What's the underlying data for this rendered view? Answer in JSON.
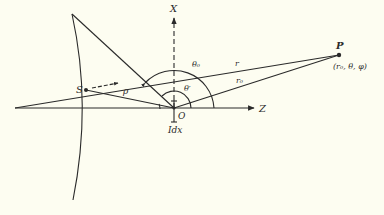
{
  "diagram": {
    "type": "geometry-figure",
    "background_color": "#fdfdf1",
    "stroke_color": "#2a2a2a",
    "labels": {
      "x_axis": "X",
      "z_axis": "Z",
      "origin": "O",
      "current_element": "Idx",
      "source_point": "S",
      "field_point": "P",
      "field_point_coords": "(r₀, θ, φ)",
      "distance_s_to_p": "r",
      "distance_o_to_p": "r₀",
      "distance_s_to_o": "ρ",
      "angle_theta0": "θ₀",
      "angle_theta_prime": "θ′"
    },
    "points": {
      "O": [
        174,
        108
      ],
      "S": [
        86,
        90
      ],
      "P": [
        339,
        55
      ],
      "apex": [
        72,
        14
      ]
    }
  }
}
